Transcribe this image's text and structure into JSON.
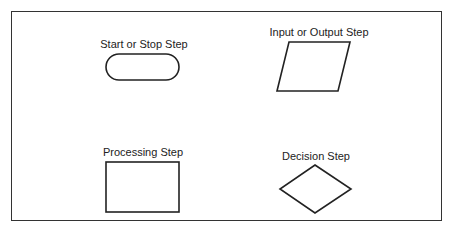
{
  "diagram": {
    "shapes": [
      {
        "id": "terminal",
        "label": "Start or Stop Step",
        "shape": "rounded-rectangle"
      },
      {
        "id": "io",
        "label": "Input or Output Step",
        "shape": "parallelogram"
      },
      {
        "id": "process",
        "label": "Processing Step",
        "shape": "rectangle"
      },
      {
        "id": "decision",
        "label": "Decision Step",
        "shape": "diamond"
      }
    ],
    "colors": {
      "stroke": "#222222",
      "background": "#ffffff"
    }
  }
}
